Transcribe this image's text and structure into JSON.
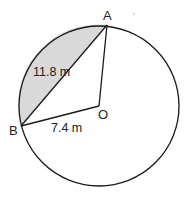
{
  "diagram": {
    "type": "circle-segment",
    "circle": {
      "center_label": "O",
      "cx": 99,
      "cy": 106,
      "r": 80
    },
    "points": {
      "A": {
        "label": "A",
        "x": 107,
        "y": 25
      },
      "B": {
        "label": "B",
        "x": 21,
        "y": 126
      },
      "O": {
        "label": "O",
        "x": 99,
        "y": 106
      }
    },
    "measurements": {
      "chord_AB": "11.8 m",
      "radius_OB": "7.4 m"
    },
    "shaded_region": "minor segment between chord AB and arc AB",
    "colors": {
      "stroke": "#1a1a1a",
      "shade": "#d9d9d9",
      "background": "#ffffff"
    }
  }
}
